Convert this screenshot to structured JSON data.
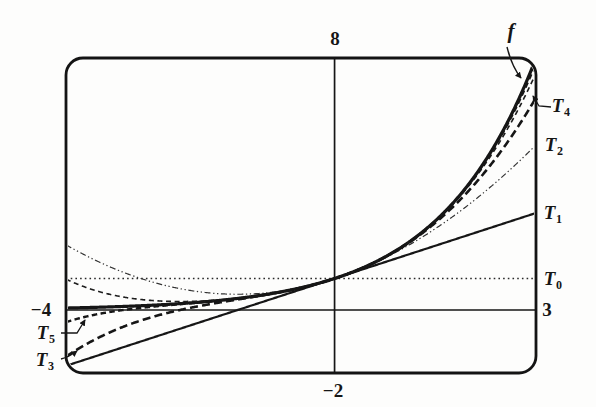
{
  "colors": {
    "ink": "#161616",
    "light_ink": "#333333",
    "background": "#fdfdfc"
  },
  "window_labels": {
    "top": "8",
    "bottom": "−2",
    "left": "−4",
    "right": "3"
  },
  "curve_labels": {
    "f": {
      "base": "f",
      "sub": ""
    },
    "t4": {
      "base": "T",
      "sub": "4"
    },
    "t2": {
      "base": "T",
      "sub": "2"
    },
    "t1": {
      "base": "T",
      "sub": "1"
    },
    "t0": {
      "base": "T",
      "sub": "0"
    },
    "t5": {
      "base": "T",
      "sub": "5"
    },
    "t3": {
      "base": "T",
      "sub": "3"
    }
  },
  "chart_data": {
    "type": "line",
    "title": "",
    "xlabel": "",
    "ylabel": "",
    "grid": false,
    "legend_position": "edge-annotations",
    "window": {
      "xmin": -4,
      "xmax": 3,
      "ymin": -2,
      "ymax": 8
    },
    "axes_through_origin": true,
    "description_of_series": "function f and its Taylor polynomials T0–T5 centered at x = 0; all curves pass through (0, 1)",
    "sample_x": [
      -4,
      -3,
      -2,
      -1,
      0,
      1,
      2,
      3
    ],
    "series": [
      {
        "name": "T0",
        "fn": "1",
        "coeffs": [
          1
        ],
        "line": "dotted",
        "weight": "light",
        "sample_y": [
          1,
          1,
          1,
          1,
          1,
          1,
          1,
          1
        ]
      },
      {
        "name": "T2",
        "fn": "1 + 0.6931x + 0.2402x^2",
        "coeffs": [
          1,
          0.693147,
          0.240227
        ],
        "line": "dashdot",
        "weight": "light",
        "sample_y": [
          2.071,
          1.083,
          0.575,
          0.547,
          1,
          1.933,
          3.347,
          5.241
        ]
      },
      {
        "name": "T1",
        "fn": "1 + 0.6931x",
        "coeffs": [
          1,
          0.693147
        ],
        "line": "solid",
        "weight": "medium",
        "sample_y": [
          -1.773,
          -1.079,
          -0.386,
          0.307,
          1,
          1.693,
          2.386,
          3.079
        ]
      },
      {
        "name": "f",
        "fn": "2^x",
        "base": 2,
        "line": "solid",
        "weight": "thick",
        "sample_y": [
          0.063,
          0.125,
          0.25,
          0.5,
          1,
          2,
          4,
          8
        ]
      },
      {
        "name": "T4",
        "fn": "1 + 0.6931x + 0.2402x^2 + 0.0555x^3 + 0.0096x^4",
        "coeffs": [
          1,
          0.693147,
          0.240227,
          0.055504,
          0.009618
        ],
        "line": "dashed",
        "weight": "medium",
        "sample_y": [
          0.981,
          0.363,
          0.284,
          0.501,
          1,
          1.998,
          3.945,
          7.519
        ]
      },
      {
        "name": "T5",
        "fn": "1 + 0.6931x + 0.2402x^2 + 0.0555x^3 + 0.0096x^4 + 0.0013x^5",
        "coeffs": [
          1,
          0.693147,
          0.240227,
          0.055504,
          0.009618,
          0.001333
        ],
        "line": "dashed",
        "weight": "bold-short",
        "sample_y": [
          -0.384,
          0.039,
          0.242,
          0.5,
          1,
          2,
          3.988,
          7.843
        ]
      },
      {
        "name": "T3",
        "fn": "1 + 0.6931x + 0.2402x^2 + 0.0555x^3",
        "coeffs": [
          1,
          0.693147,
          0.240227,
          0.055504
        ],
        "line": "dashed",
        "weight": "bold",
        "sample_y": [
          -1.481,
          -0.416,
          0.131,
          0.492,
          1,
          1.989,
          3.791,
          6.74
        ]
      }
    ]
  }
}
